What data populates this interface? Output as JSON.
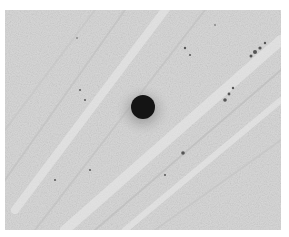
{
  "image": {
    "description": "Grayscale micrograph showing a dark circular spot on a light textured surface with diagonal streaks",
    "colors": {
      "background": "#d6d6d6",
      "streak_light": "#e6e6e6",
      "streak_dark": "#b8b8b8",
      "spot": "#141414",
      "page": "#ffffff"
    }
  }
}
